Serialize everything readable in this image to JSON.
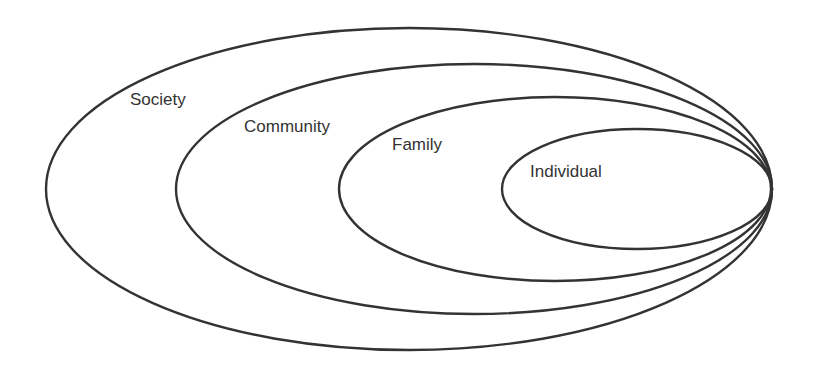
{
  "diagram": {
    "type": "nested-ellipses",
    "stroke_color": "#333333",
    "background": "#ffffff",
    "levels": [
      {
        "label": "Society",
        "cx": 409,
        "cy": 189,
        "rx": 363,
        "ry": 161,
        "label_x": 130,
        "label_y": 105
      },
      {
        "label": "Community",
        "cx": 474,
        "cy": 189,
        "rx": 298,
        "ry": 125,
        "label_x": 244,
        "label_y": 132
      },
      {
        "label": "Family",
        "cx": 555,
        "cy": 189,
        "rx": 216,
        "ry": 92,
        "label_x": 392,
        "label_y": 150
      },
      {
        "label": "Individual",
        "cx": 637,
        "cy": 189,
        "rx": 135,
        "ry": 60,
        "label_x": 530,
        "label_y": 177
      }
    ]
  }
}
